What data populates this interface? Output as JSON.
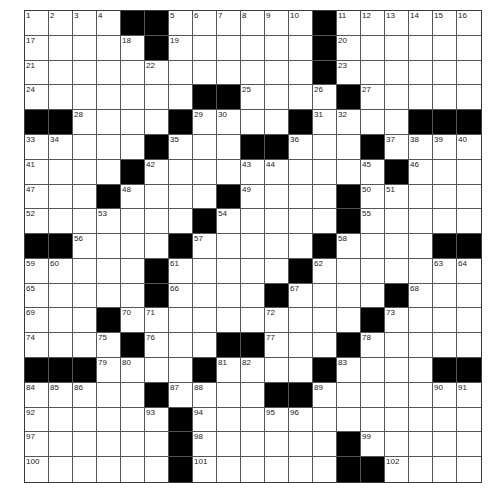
{
  "puzzle": {
    "rows": 19,
    "cols": 19,
    "colors": {
      "block": "#000000",
      "cell": "#fefefe",
      "grid_line": "#555555",
      "number": "#222222"
    },
    "grid": [
      [
        "1",
        "2",
        "3",
        "4",
        "#",
        "#",
        "5",
        "6",
        "7",
        "8",
        "9",
        "10",
        "#",
        "11",
        "12",
        "13",
        "14",
        "15",
        "16"
      ],
      [
        "17",
        "",
        "",
        "",
        "18",
        "#",
        "19",
        "",
        "",
        "",
        "",
        "",
        "#",
        "20",
        "",
        "",
        "",
        "",
        ""
      ],
      [
        "21",
        "",
        "",
        "",
        "",
        "22",
        "",
        "",
        "",
        "",
        "",
        "",
        "#",
        "23",
        "",
        "",
        "",
        "",
        ""
      ],
      [
        "24",
        "",
        "",
        "",
        "",
        "",
        "",
        "#",
        "#",
        "25",
        "",
        "",
        "26",
        "#",
        "27",
        "",
        "",
        "",
        ""
      ],
      [
        "#",
        "#",
        "28",
        "",
        "",
        "",
        "#",
        "29",
        "30",
        "",
        "",
        "#",
        "31",
        "32",
        "",
        "",
        "#",
        "#",
        "#"
      ],
      [
        "33",
        "34",
        "",
        "",
        "",
        "#",
        "35",
        "",
        "",
        "#",
        "#",
        "36",
        "",
        "",
        "#",
        "37",
        "38",
        "39",
        "40"
      ],
      [
        "41",
        "",
        "",
        "",
        "#",
        "42",
        "",
        "",
        "",
        "43",
        "44",
        "",
        "",
        "",
        "45",
        "#",
        "46",
        "",
        ""
      ],
      [
        "47",
        "",
        "",
        "#",
        "48",
        "",
        "",
        "",
        "#",
        "49",
        "",
        "",
        "",
        "#",
        "50",
        "51",
        "",
        "",
        ""
      ],
      [
        "52",
        "",
        "",
        "53",
        "",
        "",
        "",
        "#",
        "54",
        "",
        "",
        "",
        "",
        "#",
        "55",
        "",
        "",
        "",
        ""
      ],
      [
        "#",
        "#",
        "56",
        "",
        "",
        "",
        "#",
        "57",
        "",
        "",
        "",
        "",
        "#",
        "58",
        "",
        "",
        "",
        "#",
        "#"
      ],
      [
        "59",
        "60",
        "",
        "",
        "",
        "#",
        "61",
        "",
        "",
        "",
        "",
        "#",
        "62",
        "",
        "",
        "",
        "",
        "63",
        "64"
      ],
      [
        "65",
        "",
        "",
        "",
        "",
        "#",
        "66",
        "",
        "",
        "",
        "#",
        "67",
        "",
        "",
        "",
        "#",
        "68",
        "",
        ""
      ],
      [
        "69",
        "",
        "",
        "#",
        "70",
        "71",
        "",
        "",
        "",
        "",
        "72",
        "",
        "",
        "",
        "#",
        "73",
        "",
        "",
        ""
      ],
      [
        "74",
        "",
        "",
        "75",
        "#",
        "76",
        "",
        "",
        "#",
        "#",
        "77",
        "",
        "",
        "#",
        "78",
        "",
        "",
        "",
        ""
      ],
      [
        "#",
        "#",
        "#",
        "79",
        "80",
        "",
        "",
        "#",
        "81",
        "82",
        "",
        "",
        "#",
        "83",
        "",
        "",
        "",
        "#",
        "#"
      ],
      [
        "84",
        "85",
        "86",
        "",
        "",
        "#",
        "87",
        "88",
        "",
        "",
        "#",
        "#",
        "89",
        "",
        "",
        "",
        "",
        "90",
        "91"
      ],
      [
        "92",
        "",
        "",
        "",
        "",
        "93",
        "#",
        "94",
        "",
        "",
        "95",
        "96",
        "",
        "",
        "",
        "",
        "",
        "",
        ""
      ],
      [
        "97",
        "",
        "",
        "",
        "",
        "",
        "#",
        "98",
        "",
        "",
        "",
        "",
        "",
        "#",
        "99",
        "",
        "",
        "",
        ""
      ],
      [
        "100",
        "",
        "",
        "",
        "",
        "",
        "#",
        "101",
        "",
        "",
        "",
        "",
        "",
        "#",
        "#",
        "102",
        "",
        "",
        ""
      ]
    ],
    "answers": []
  }
}
